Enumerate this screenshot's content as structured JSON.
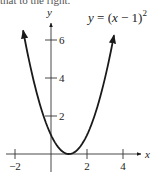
{
  "cropped_text": "that to the right.",
  "chart_data": {
    "type": "line",
    "equation_label": {
      "lhs": "y",
      "rhs": "(x − 1)",
      "exponent": "2"
    },
    "xlabel": "x",
    "ylabel": "y",
    "xlim": [
      -2.1,
      4.9
    ],
    "ylim": [
      -0.9,
      7.3
    ],
    "x_ticks": [
      -2,
      2,
      4
    ],
    "x_tick_labels": [
      "−2",
      "2",
      "4"
    ],
    "y_ticks": [
      2,
      4,
      6
    ],
    "y_tick_labels": [
      "2",
      "4",
      "6"
    ],
    "grid": false,
    "series": [
      {
        "name": "y = (x − 1)²",
        "x": [
          -1.55,
          -1,
          -0.5,
          0,
          0.5,
          1,
          1.5,
          2,
          2.5,
          3,
          3.5
        ],
        "y": [
          6.5,
          4,
          2.25,
          1,
          0.25,
          0,
          0.25,
          1,
          2.25,
          4,
          6.25
        ],
        "arrows_at_ends": true
      }
    ],
    "vertex": [
      1,
      0
    ]
  },
  "colors": {
    "line": "#1a1a1a",
    "axis": "#333333",
    "text": "#222222"
  }
}
